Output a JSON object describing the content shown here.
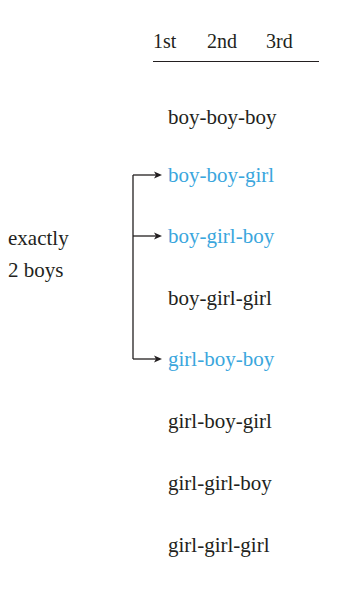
{
  "header": {
    "columns": [
      "1st",
      "2nd",
      "3rd"
    ]
  },
  "outcomes": [
    {
      "text": "boy-boy-boy",
      "highlighted": false
    },
    {
      "text": "boy-boy-girl",
      "highlighted": true
    },
    {
      "text": "boy-girl-boy",
      "highlighted": true
    },
    {
      "text": "boy-girl-girl",
      "highlighted": false
    },
    {
      "text": "girl-boy-boy",
      "highlighted": true
    },
    {
      "text": "girl-boy-girl",
      "highlighted": false
    },
    {
      "text": "girl-girl-boy",
      "highlighted": false
    },
    {
      "text": "girl-girl-girl",
      "highlighted": false
    }
  ],
  "bracket_label": {
    "line1": "exactly",
    "line2": "2 boys"
  },
  "colors": {
    "text": "#231f20",
    "highlight": "#3aa6dd"
  }
}
